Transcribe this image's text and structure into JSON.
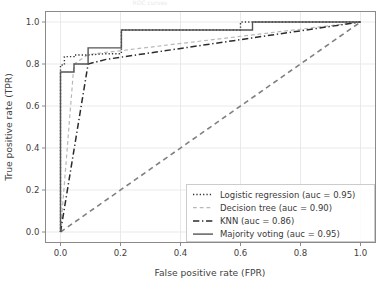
{
  "figure": {
    "width": 386,
    "height": 288,
    "background": "#ffffff",
    "partial_title": "ROC curves"
  },
  "chart_data": {
    "type": "line",
    "title": "",
    "xlabel": "False positive rate (FPR)",
    "ylabel": "True positive rate (TPR)",
    "xlim": [
      -0.05,
      1.05
    ],
    "ylim": [
      -0.05,
      1.05
    ],
    "xticks": [
      0.0,
      0.2,
      0.4,
      0.6,
      0.8,
      1.0
    ],
    "xticklabels": [
      "0.0",
      "0.2",
      "0.4",
      "0.6",
      "0.8",
      "1.0"
    ],
    "yticks": [
      0.0,
      0.2,
      0.4,
      0.6,
      0.8,
      1.0
    ],
    "yticklabels": [
      "0.0",
      "0.2",
      "0.4",
      "0.6",
      "0.8",
      "1.0"
    ],
    "grid": true,
    "grid_color": "#e6e6e6",
    "legend_position": "lower right",
    "series": [
      {
        "name": "Logistic regression",
        "auc": 0.95,
        "legend_label": "Logistic regression (auc = 0.95)",
        "linestyle": "dotted",
        "color": "#333333",
        "linewidth": 1.4,
        "x": [
          0.0,
          0.0,
          0.013,
          0.013,
          0.045,
          0.045,
          0.092,
          0.152,
          0.203,
          0.203,
          0.6,
          0.6,
          1.0
        ],
        "y": [
          0.0,
          0.795,
          0.795,
          0.835,
          0.835,
          0.843,
          0.843,
          0.849,
          0.849,
          0.962,
          0.962,
          1.0,
          1.0
        ]
      },
      {
        "name": "Decision tree",
        "auc": 0.9,
        "legend_label": "Decision tree (auc = 0.90)",
        "linestyle": "dashed",
        "color": "#b8b8b8",
        "linewidth": 1.2,
        "x": [
          0.0,
          0.045,
          0.092,
          1.0
        ],
        "y": [
          0.0,
          0.8,
          0.845,
          1.0
        ]
      },
      {
        "name": "KNN",
        "auc": 0.86,
        "legend_label": "KNN (auc = 0.86)",
        "linestyle": "dashdot",
        "color": "#2b2b2b",
        "linewidth": 1.5,
        "x": [
          0.0,
          0.092,
          0.152,
          1.0
        ],
        "y": [
          0.0,
          0.8,
          0.822,
          1.0
        ]
      },
      {
        "name": "Majority voting",
        "auc": 0.95,
        "legend_label": "Majority voting (auc = 0.95)",
        "linestyle": "solid",
        "color": "#555555",
        "linewidth": 1.4,
        "x": [
          0.0,
          0.0,
          0.045,
          0.045,
          0.092,
          0.092,
          0.152,
          0.152,
          0.203,
          0.203,
          0.64,
          0.64,
          1.0
        ],
        "y": [
          0.0,
          0.762,
          0.762,
          0.8,
          0.8,
          0.877,
          0.877,
          0.877,
          0.877,
          0.962,
          0.962,
          1.0,
          1.0
        ]
      }
    ],
    "reference_line": {
      "name": "chance-diagonal",
      "linestyle": "dashed",
      "color": "#808080",
      "linewidth": 1.6,
      "x": [
        0.0,
        1.0
      ],
      "y": [
        0.0,
        1.0
      ]
    }
  },
  "legend": {
    "entries": [
      {
        "label": "Logistic regression (auc = 0.95)",
        "style": "dotted",
        "color": "#333333"
      },
      {
        "label": "Decision tree (auc = 0.90)",
        "style": "dashed",
        "color": "#b8b8b8"
      },
      {
        "label": "KNN (auc = 0.86)",
        "style": "dashdot",
        "color": "#2b2b2b"
      },
      {
        "label": "Majority voting (auc = 0.95)",
        "style": "solid",
        "color": "#555555"
      }
    ]
  }
}
